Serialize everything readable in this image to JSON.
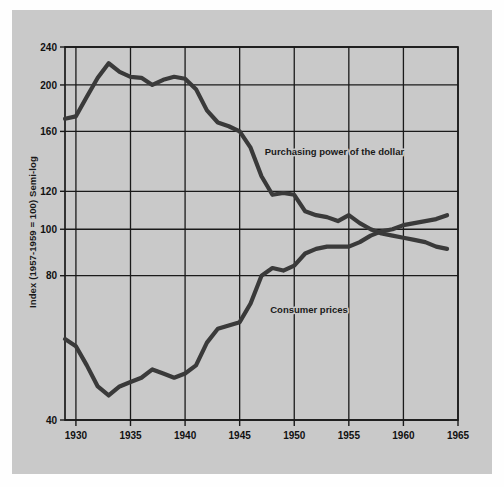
{
  "figure": {
    "background_color": "#c9c9c9",
    "page_color": "#fefefe",
    "line_color": "#3a3a3a",
    "axis_color": "#1a1a1a"
  },
  "chart_data": {
    "type": "line",
    "title": "",
    "xlabel": "",
    "ylabel": "Index (1957-1959 = 100) Semi-log",
    "scale": "semi-log",
    "grid": true,
    "legend_position": "inline-annotations",
    "xlim": [
      1929,
      1965
    ],
    "ylim": [
      40,
      240
    ],
    "xticks": [
      1930,
      1935,
      1940,
      1945,
      1950,
      1955,
      1960,
      1965
    ],
    "xtick_labels": [
      "1930",
      "1935",
      "1940",
      "1945",
      "1950",
      "1955",
      "1960",
      "1965"
    ],
    "yticks": [
      40,
      80,
      100,
      120,
      160,
      200,
      240
    ],
    "ytick_labels": [
      "40",
      "80",
      "100",
      "120",
      "160",
      "200",
      "240"
    ],
    "series": [
      {
        "name": "Purchasing power of the dollar",
        "annotation": "Purchasing power of the dollar",
        "annotation_x": 1947.3,
        "annotation_y": 143,
        "x": [
          1929,
          1930,
          1931,
          1932,
          1933,
          1934,
          1935,
          1936,
          1937,
          1938,
          1939,
          1940,
          1941,
          1942,
          1943,
          1944,
          1945,
          1946,
          1947,
          1948,
          1949,
          1950,
          1951,
          1952,
          1953,
          1954,
          1955,
          1956,
          1957,
          1958,
          1959,
          1960,
          1961,
          1962,
          1963,
          1964
        ],
        "y": [
          170,
          172,
          189,
          207,
          222,
          213,
          208,
          207,
          200,
          205,
          208,
          206,
          196,
          177,
          167,
          164,
          160,
          148,
          129,
          118,
          119,
          118,
          109,
          107,
          106,
          104,
          107,
          103,
          100,
          98,
          97,
          96,
          95,
          94,
          92,
          91
        ]
      },
      {
        "name": "Consumer prices",
        "annotation": "Consumer prices",
        "annotation_x": 1947.8,
        "annotation_y": 67,
        "x": [
          1929,
          1930,
          1931,
          1932,
          1933,
          1934,
          1935,
          1936,
          1937,
          1938,
          1939,
          1940,
          1941,
          1942,
          1943,
          1944,
          1945,
          1946,
          1947,
          1948,
          1949,
          1950,
          1951,
          1952,
          1953,
          1954,
          1955,
          1956,
          1957,
          1958,
          1959,
          1960,
          1961,
          1962,
          1963,
          1964
        ],
        "y": [
          59,
          57,
          52,
          47,
          45,
          47,
          48,
          49,
          51,
          50,
          49,
          50,
          52,
          58,
          62,
          63,
          64,
          70,
          80,
          83,
          82,
          84,
          89,
          91,
          92,
          92,
          92,
          94,
          97,
          99,
          100,
          102,
          103,
          104,
          105,
          107
        ]
      }
    ]
  },
  "annotations": {
    "purchasing_power": "Purchasing power of the dollar",
    "consumer_prices": "Consumer prices"
  }
}
